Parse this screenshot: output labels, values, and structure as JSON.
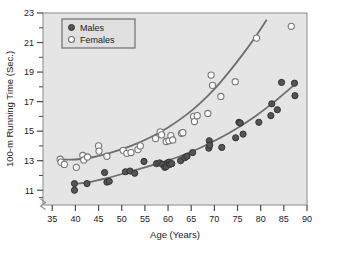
{
  "chart_data": {
    "type": "scatter",
    "title": "",
    "xlabel": "Age (Years)",
    "ylabel": "100-m Running Time (Sec.)",
    "xlim": [
      33,
      90
    ],
    "ylim": [
      10.0,
      23.0
    ],
    "xticks": [
      35,
      40,
      45,
      50,
      55,
      60,
      65,
      70,
      75,
      80,
      85,
      90
    ],
    "yticks": [
      11,
      13,
      15,
      17,
      19,
      21,
      23
    ],
    "minor_ticks": true,
    "grid": false,
    "axis_break": true,
    "legend_position": "top-left",
    "colors": {
      "males_marker": "#555555",
      "males_edge": "#333333",
      "females_marker": "#ffffff",
      "females_edge": "#777777",
      "curve": "#6e6e6e",
      "plot_background": "#e5e5e5",
      "page_background": "#ffffff",
      "text": "#1a1a1a"
    },
    "series": [
      {
        "name": "Males",
        "marker": "filled-circle",
        "points": [
          [
            39.8,
            11.45
          ],
          [
            39.8,
            11.0
          ],
          [
            42.5,
            11.45
          ],
          [
            46.3,
            12.2
          ],
          [
            46.8,
            11.55
          ],
          [
            47.3,
            11.6
          ],
          [
            50.8,
            12.25
          ],
          [
            51.8,
            12.3
          ],
          [
            52.8,
            12.15
          ],
          [
            54.8,
            12.95
          ],
          [
            57.5,
            12.8
          ],
          [
            58.2,
            12.85
          ],
          [
            58.8,
            12.75
          ],
          [
            59.3,
            12.55
          ],
          [
            59.6,
            12.6
          ],
          [
            59.9,
            12.85
          ],
          [
            60.2,
            12.9
          ],
          [
            60.4,
            12.75
          ],
          [
            60.8,
            12.8
          ],
          [
            62.7,
            13.0
          ],
          [
            63.6,
            13.2
          ],
          [
            64.1,
            13.3
          ],
          [
            65.3,
            13.55
          ],
          [
            68.8,
            13.85
          ],
          [
            68.9,
            14.35
          ],
          [
            69.0,
            14.05
          ],
          [
            71.6,
            13.9
          ],
          [
            74.6,
            14.55
          ],
          [
            75.3,
            15.6
          ],
          [
            75.6,
            15.55
          ],
          [
            76.2,
            14.8
          ],
          [
            79.6,
            15.6
          ],
          [
            82.2,
            16.05
          ],
          [
            82.4,
            16.85
          ],
          [
            83.6,
            16.45
          ],
          [
            84.5,
            18.3
          ],
          [
            87.3,
            18.25
          ],
          [
            87.4,
            17.4
          ]
        ]
      },
      {
        "name": "Females",
        "marker": "open-circle",
        "points": [
          [
            36.7,
            13.1
          ],
          [
            36.9,
            12.9
          ],
          [
            37.6,
            12.75
          ],
          [
            40.2,
            12.55
          ],
          [
            41.6,
            13.35
          ],
          [
            41.8,
            13.05
          ],
          [
            42.6,
            13.25
          ],
          [
            45.0,
            14.0
          ],
          [
            45.1,
            13.65
          ],
          [
            46.8,
            13.3
          ],
          [
            50.3,
            13.7
          ],
          [
            51.1,
            13.5
          ],
          [
            52.0,
            13.55
          ],
          [
            53.5,
            13.75
          ],
          [
            54.0,
            14.0
          ],
          [
            57.3,
            14.5
          ],
          [
            58.3,
            14.95
          ],
          [
            58.6,
            14.75
          ],
          [
            59.6,
            14.3
          ],
          [
            60.2,
            14.35
          ],
          [
            60.6,
            14.7
          ],
          [
            61.0,
            14.4
          ],
          [
            62.9,
            14.85
          ],
          [
            63.2,
            14.9
          ],
          [
            65.5,
            16.0
          ],
          [
            65.7,
            15.65
          ],
          [
            66.3,
            16.05
          ],
          [
            68.6,
            16.2
          ],
          [
            69.3,
            18.8
          ],
          [
            69.6,
            18.1
          ],
          [
            71.4,
            17.35
          ],
          [
            74.5,
            18.35
          ],
          [
            79.1,
            21.3
          ],
          [
            86.6,
            22.1
          ]
        ]
      }
    ],
    "fit_curves": [
      {
        "name": "Males fit",
        "points": [
          [
            39.5,
            11.42
          ],
          [
            43,
            11.55
          ],
          [
            47,
            11.83
          ],
          [
            51,
            12.18
          ],
          [
            55,
            12.55
          ],
          [
            59,
            12.92
          ],
          [
            63,
            13.35
          ],
          [
            67,
            13.88
          ],
          [
            71,
            14.5
          ],
          [
            75,
            15.22
          ],
          [
            79,
            16.05
          ],
          [
            83,
            17.0
          ],
          [
            87.5,
            18.2
          ]
        ]
      },
      {
        "name": "Females fit",
        "points": [
          [
            36.2,
            13.1
          ],
          [
            40,
            13.08
          ],
          [
            44,
            13.25
          ],
          [
            48,
            13.58
          ],
          [
            52,
            14.0
          ],
          [
            56,
            14.55
          ],
          [
            60,
            15.25
          ],
          [
            64,
            16.12
          ],
          [
            67,
            16.92
          ],
          [
            70,
            17.85
          ],
          [
            73,
            18.95
          ],
          [
            76,
            20.15
          ],
          [
            79,
            21.45
          ],
          [
            81.3,
            22.55
          ]
        ]
      }
    ]
  },
  "legend": {
    "entries": [
      {
        "label": "Males",
        "marker": "filled-circle"
      },
      {
        "label": "Females",
        "marker": "open-circle"
      }
    ]
  },
  "axes": {
    "x_title": "Age (Years)",
    "y_title": "100-m Running Time (Sec.)",
    "x_tick_labels": [
      "35",
      "40",
      "45",
      "50",
      "55",
      "60",
      "65",
      "70",
      "75",
      "80",
      "85",
      "90"
    ],
    "y_tick_labels": [
      "11",
      "13",
      "15",
      "17",
      "19",
      "21",
      "23"
    ]
  }
}
